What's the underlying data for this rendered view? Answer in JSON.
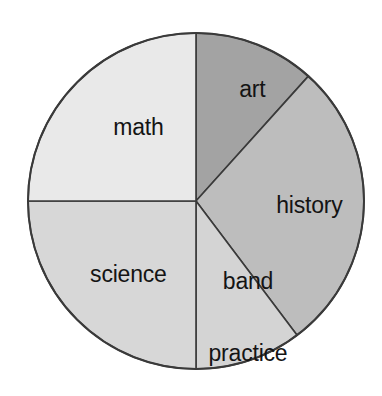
{
  "chart_data": {
    "type": "pie",
    "title": "",
    "subtitle": "",
    "xlabel": "",
    "ylabel": "",
    "legend": "none",
    "grid": false,
    "units": "fraction of circle",
    "total_degrees": 360,
    "start_angle_deg": 0,
    "direction": "clockwise",
    "categories": [
      "art",
      "history",
      "band practice",
      "science",
      "math"
    ],
    "values": [
      11.7,
      28.1,
      10.2,
      25.0,
      25.0
    ],
    "slices": [
      {
        "label": "art",
        "label_lines": [
          "art"
        ],
        "value_percent": 11.7,
        "start_angle_deg": 0,
        "end_angle_deg": 42,
        "sweep_deg": 42,
        "color": "#a3a3a3",
        "label_x": 240,
        "label_y": 90
      },
      {
        "label": "history",
        "label_lines": [
          "history"
        ],
        "value_percent": 28.1,
        "start_angle_deg": 42,
        "end_angle_deg": 143,
        "sweep_deg": 101,
        "color": "#bdbdbd",
        "label_x": 297,
        "label_y": 206
      },
      {
        "label": "band practice",
        "label_lines": [
          "band",
          "practice"
        ],
        "value_percent": 10.2,
        "start_angle_deg": 143,
        "end_angle_deg": 180,
        "sweep_deg": 37,
        "color": "#d4d4d4",
        "label_x": 248,
        "label_y": 318
      },
      {
        "label": "science",
        "label_lines": [
          "science"
        ],
        "value_percent": 25.0,
        "start_angle_deg": 180,
        "end_angle_deg": 270,
        "sweep_deg": 90,
        "color": "#d7d7d7",
        "label_x": 116,
        "label_y": 275
      },
      {
        "label": "math",
        "label_lines": [
          "math"
        ],
        "value_percent": 25.0,
        "start_angle_deg": 270,
        "end_angle_deg": 360,
        "sweep_deg": 90,
        "color": "#e9e9e9",
        "label_x": 126,
        "label_y": 128
      }
    ],
    "geometry": {
      "center_x": 196,
      "center_y": 201,
      "radius": 168
    },
    "style": {
      "background": "#ffffff",
      "outline_color": "#3a3a3a",
      "label_color": "#141414"
    }
  },
  "labels": {
    "math": "math",
    "art": "art",
    "history": "history",
    "science": "science",
    "band_line1": "band",
    "band_line2": "practice"
  }
}
